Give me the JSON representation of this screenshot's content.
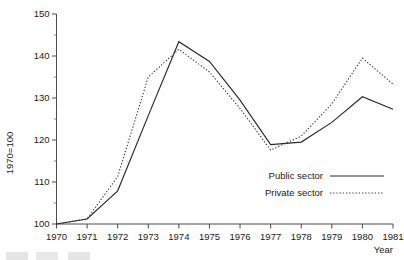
{
  "chart_data": {
    "type": "line",
    "title": "",
    "xlabel": "Year",
    "ylabel": "1970=100",
    "categories": [
      "1970",
      "1971",
      "1972",
      "1973",
      "1974",
      "1975",
      "1976",
      "1977",
      "1978",
      "1979",
      "1980",
      "1981"
    ],
    "x": [
      1970,
      1971,
      1972,
      1973,
      1974,
      1975,
      1976,
      1977,
      1978,
      1979,
      1980,
      1981
    ],
    "xlim": [
      1970,
      1981
    ],
    "ylim": [
      100,
      150
    ],
    "yticks": [
      100,
      110,
      120,
      130,
      140,
      150
    ],
    "yticks_minor": [
      105,
      115,
      125,
      135,
      145
    ],
    "grid": false,
    "legend_position": "center-right",
    "series": [
      {
        "name": "Public sector",
        "style": "solid",
        "color": "#2a2a2a",
        "values": [
          100.0,
          101.2,
          107.9,
          125.8,
          143.4,
          138.7,
          129.5,
          118.9,
          119.5,
          124.2,
          130.3,
          127.3
        ]
      },
      {
        "name": "Private sector",
        "style": "dotted",
        "color": "#3a3a3a",
        "values": [
          100.0,
          101.2,
          111.3,
          135.0,
          141.6,
          136.2,
          127.5,
          117.6,
          120.9,
          128.6,
          139.5,
          133.3
        ]
      }
    ]
  },
  "axes": {
    "y_axis_title": "1970=100",
    "x_axis_title": "Year",
    "y_tick_labels": [
      "100",
      "110",
      "120",
      "130",
      "140",
      "150"
    ],
    "x_tick_labels": [
      "1970",
      "1971",
      "1972",
      "1973",
      "1974",
      "1975",
      "1976",
      "1977",
      "1978",
      "1979",
      "1980",
      "1981"
    ]
  },
  "legend": {
    "items": [
      {
        "label": "Public sector",
        "style": "solid"
      },
      {
        "label": "Private sector",
        "style": "dotted"
      }
    ]
  }
}
